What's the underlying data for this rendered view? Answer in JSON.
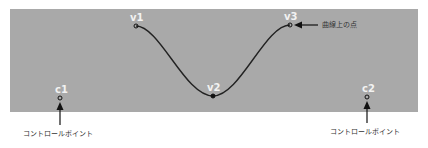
{
  "diagram": {
    "points": {
      "v1": {
        "label": "v1",
        "x": 136,
        "y": 26
      },
      "v2": {
        "label": "v2",
        "x": 213,
        "y": 96
      },
      "v3": {
        "label": "v3",
        "x": 290,
        "y": 25
      },
      "c1": {
        "label": "c1",
        "x": 60,
        "y": 98
      },
      "c2": {
        "label": "c2",
        "x": 367,
        "y": 97
      }
    },
    "annotations": {
      "curve_point": "曲線上の点",
      "control_point_left": "コントロールポイント",
      "control_point_right": "コントロールポイント"
    },
    "colors": {
      "panel": "#a9a9a9",
      "curve": "#222222",
      "label": "#f2f2f2"
    }
  }
}
